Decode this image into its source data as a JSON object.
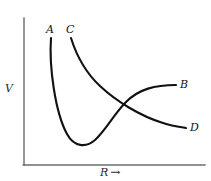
{
  "figure": {
    "title": "",
    "background_color": "#ffffff",
    "width": 211,
    "height": 181
  },
  "axes": {
    "y_axis": {
      "label": "V",
      "name": "y-axis",
      "color": "#6b6b6b",
      "x": 24,
      "y_top": 18,
      "y_bottom": 165
    },
    "x_axis": {
      "label": "R",
      "arrow": "→",
      "name": "x-axis",
      "color": "#6b6b6b",
      "y": 165,
      "x_left": 24,
      "x_right": 205
    }
  },
  "curves": [
    {
      "id": "AB",
      "start_label": "A",
      "end_label": "B",
      "color": "#111111",
      "stroke_width": 2.1,
      "description": "Steeply repulsive at small R, deep minimum, rises and levels off to asymptote B",
      "path": "M 51 38 C 49 66, 55 112, 67 134 C 74 147, 86 148, 95 140 C 106 130, 114 114, 126 102 C 139 89, 155 85, 176 85"
    },
    {
      "id": "CD",
      "start_label": "C",
      "end_label": "D",
      "color": "#111111",
      "stroke_width": 2.1,
      "description": "Monotonically decreasing repulsive curve from C decaying toward asymptote D",
      "path": "M 71 38 C 76 54, 86 73, 100 86 C 116 101, 140 116, 163 123 C 172 126, 180 127, 186 128"
    }
  ],
  "labels": {
    "A": "A",
    "B": "B",
    "C": "C",
    "D": "D",
    "V": "V",
    "R": "R",
    "R_arrow": "→"
  },
  "chart_data": {
    "type": "line",
    "title": "",
    "xlabel": "R",
    "ylabel": "V",
    "grid": false,
    "legend": "inline-endpoint-labels",
    "series": [
      {
        "name": "A–B",
        "start_label": "A",
        "end_label": "B",
        "shape": "Lennard-Jones-like potential well",
        "points": [
          {
            "x": 51,
            "y": 38
          },
          {
            "x": 60,
            "y": 110
          },
          {
            "x": 70,
            "y": 138
          },
          {
            "x": 78,
            "y": 145
          },
          {
            "x": 90,
            "y": 143
          },
          {
            "x": 105,
            "y": 127
          },
          {
            "x": 119,
            "y": 103
          },
          {
            "x": 140,
            "y": 90
          },
          {
            "x": 160,
            "y": 86
          },
          {
            "x": 176,
            "y": 85
          }
        ]
      },
      {
        "name": "C–D",
        "start_label": "C",
        "end_label": "D",
        "shape": "monotonic decaying repulsive curve",
        "points": [
          {
            "x": 71,
            "y": 38
          },
          {
            "x": 80,
            "y": 57
          },
          {
            "x": 92,
            "y": 77
          },
          {
            "x": 105,
            "y": 92
          },
          {
            "x": 119,
            "y": 103
          },
          {
            "x": 140,
            "y": 114
          },
          {
            "x": 160,
            "y": 122
          },
          {
            "x": 186,
            "y": 128
          }
        ]
      }
    ],
    "annotations": [
      {
        "text": "A",
        "x": 50,
        "y": 30,
        "role": "curve-start-label"
      },
      {
        "text": "C",
        "x": 70,
        "y": 30,
        "role": "curve-start-label"
      },
      {
        "text": "B",
        "x": 183,
        "y": 85,
        "role": "curve-end-label"
      },
      {
        "text": "D",
        "x": 193,
        "y": 128,
        "role": "curve-end-label"
      }
    ],
    "intersection": {
      "x": 119,
      "y": 103
    }
  }
}
